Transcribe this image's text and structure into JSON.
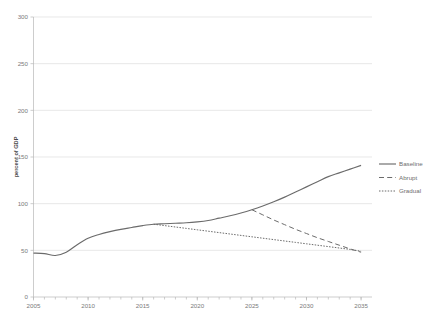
{
  "chart_data": {
    "type": "line",
    "title": "",
    "xlabel": "",
    "ylabel": "percent of GDP",
    "xlim": [
      2005,
      2036
    ],
    "ylim": [
      0,
      300
    ],
    "grid": true,
    "legend_position": "right",
    "x_ticks": [
      "2005",
      "2010",
      "2015",
      "2020",
      "2025",
      "2030",
      "2035"
    ],
    "y_ticks": [
      "0",
      "50",
      "100",
      "150",
      "200",
      "250",
      "300"
    ],
    "series": [
      {
        "name": "Baseline",
        "style": "solid",
        "color": "#6b6b6b",
        "x": [
          2005,
          2006,
          2007,
          2008,
          2009,
          2010,
          2011,
          2012,
          2013,
          2014,
          2015,
          2016,
          2017,
          2018,
          2019,
          2020,
          2021,
          2022,
          2023,
          2024,
          2025,
          2026,
          2027,
          2028,
          2029,
          2030,
          2031,
          2032,
          2033,
          2034,
          2035
        ],
        "values": [
          47,
          46.5,
          44.5,
          48,
          56,
          63,
          67,
          70,
          72.5,
          74.5,
          76.5,
          78,
          78.5,
          79,
          79.5,
          80.5,
          82,
          84.5,
          87,
          90,
          93.5,
          97.5,
          102,
          107,
          112.5,
          118,
          123.5,
          129,
          133,
          137,
          141
        ]
      },
      {
        "name": "Abrupt",
        "style": "dashed",
        "color": "#6b6b6b",
        "x": [
          2025,
          2026,
          2027,
          2028,
          2029,
          2030,
          2031,
          2032,
          2033,
          2034,
          2035
        ],
        "values": [
          93.5,
          88,
          82.5,
          77.5,
          72.5,
          68,
          63.5,
          59.5,
          55.5,
          51.5,
          48
        ]
      },
      {
        "name": "Gradual",
        "style": "dotted",
        "color": "#6b6b6b",
        "x": [
          2016,
          2017,
          2018,
          2019,
          2020,
          2021,
          2022,
          2023,
          2024,
          2025,
          2026,
          2027,
          2028,
          2029,
          2030,
          2031,
          2032,
          2033,
          2034,
          2035
        ],
        "values": [
          78,
          76.5,
          75,
          73.5,
          72,
          70.5,
          69,
          67.5,
          66,
          64.5,
          63,
          61.5,
          60,
          58.5,
          57,
          55.5,
          54,
          52.5,
          51,
          49
        ]
      }
    ]
  },
  "legend": {
    "items": [
      {
        "label": "Baseline",
        "style": "solid"
      },
      {
        "label": "Abrupt",
        "style": "dashed"
      },
      {
        "label": "Gradual",
        "style": "dotted"
      }
    ]
  },
  "axis": {
    "y_title": "percent of GDP"
  }
}
